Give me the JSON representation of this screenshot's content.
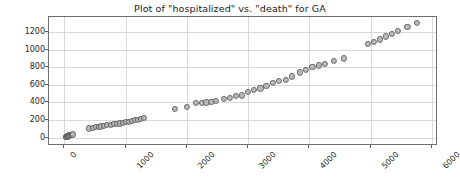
{
  "chart_data": {
    "type": "scatter",
    "title": "Plot of \"hospitalized\" vs. \"death\" for GA",
    "xlabel": "",
    "ylabel": "",
    "xlim": [
      -250,
      6100
    ],
    "ylim": [
      -95,
      1370
    ],
    "grid": true,
    "legend": null,
    "marker": {
      "shape": "circle",
      "facecolor": "#b5b5b5",
      "edgecolor": "#5d5d5d",
      "size": 6
    },
    "xticks": [
      0,
      1000,
      2000,
      3000,
      4000,
      5000,
      6000
    ],
    "xticklabels": [
      "0",
      "1000",
      "2000",
      "3000",
      "4000",
      "5000",
      "6000"
    ],
    "xtick_rotation": -45,
    "yticks": [
      0,
      200,
      400,
      600,
      800,
      1000,
      1200
    ],
    "yticklabels": [
      "0",
      "200",
      "400",
      "600",
      "800",
      "1000",
      "1200"
    ],
    "x": [
      25,
      35,
      40,
      45,
      50,
      55,
      60,
      65,
      70,
      80,
      95,
      110,
      125,
      140,
      405,
      470,
      520,
      560,
      600,
      640,
      700,
      760,
      810,
      860,
      905,
      950,
      1000,
      1050,
      1100,
      1150,
      1200,
      1250,
      1300,
      1800,
      2000,
      2150,
      2250,
      2320,
      2400,
      2480,
      2600,
      2700,
      2800,
      2900,
      3000,
      3100,
      3200,
      3300,
      3400,
      3500,
      3620,
      3720,
      3850,
      3950,
      4050,
      4150,
      4250,
      4400,
      4560,
      4950,
      5050,
      5150,
      5250,
      5350,
      5450,
      5600,
      5750
    ],
    "y": [
      5,
      8,
      10,
      12,
      14,
      16,
      18,
      20,
      22,
      25,
      28,
      30,
      33,
      36,
      105,
      115,
      120,
      125,
      128,
      132,
      140,
      148,
      152,
      158,
      162,
      168,
      175,
      182,
      190,
      198,
      205,
      212,
      220,
      330,
      345,
      390,
      398,
      400,
      405,
      415,
      440,
      450,
      470,
      480,
      520,
      540,
      560,
      585,
      620,
      640,
      660,
      695,
      740,
      770,
      800,
      820,
      840,
      870,
      900,
      1060,
      1090,
      1115,
      1150,
      1180,
      1210,
      1260,
      1300
    ]
  }
}
